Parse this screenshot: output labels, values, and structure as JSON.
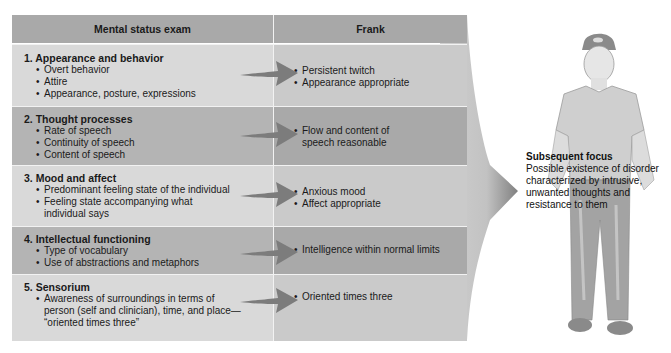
{
  "table": {
    "headers": {
      "left": "Mental status exam",
      "right": "Frank"
    },
    "rows": [
      {
        "title": "1. Appearance and behavior",
        "bullets": [
          "Overt behavior",
          "Attire",
          "Appearance, posture, expressions"
        ],
        "findings": [
          "Persistent twitch",
          "Appearance appropriate"
        ]
      },
      {
        "title": "2. Thought processes",
        "bullets": [
          "Rate of speech",
          "Continuity of speech",
          "Content of speech"
        ],
        "findings": [
          "Flow and content of",
          "speech reasonable"
        ]
      },
      {
        "title": "3. Mood and affect",
        "bullets": [
          "Predominant feeling state of the individual",
          "Feeling state accompanying what",
          "individual says"
        ],
        "findings": [
          "Anxious mood",
          "Affect appropriate"
        ]
      },
      {
        "title": "4. Intellectual functioning",
        "bullets": [
          "Type of vocabulary",
          "Use of abstractions and metaphors"
        ],
        "findings": [
          "Intelligence within normal limits"
        ]
      },
      {
        "title": "5. Sensorium",
        "bullets": [
          "Awareness of surroundings in terms of",
          "person (self and clinician), time, and place—",
          "“oriented times three”"
        ],
        "findings": [
          "Oriented times three"
        ]
      }
    ]
  },
  "focus": {
    "title": "Subsequent focus",
    "lines": [
      "Possible existence of disorder",
      "characterized by intrusive,",
      "unwanted thoughts and",
      "resistance to them"
    ]
  },
  "colors": {
    "header": "#a8a8a8",
    "row_light_left": "#d9d9d9",
    "row_light_right": "#cacaca",
    "row_dark_left": "#b4b4b4",
    "row_dark_right": "#a9a9a9",
    "arrow": "#7a7a7a"
  }
}
